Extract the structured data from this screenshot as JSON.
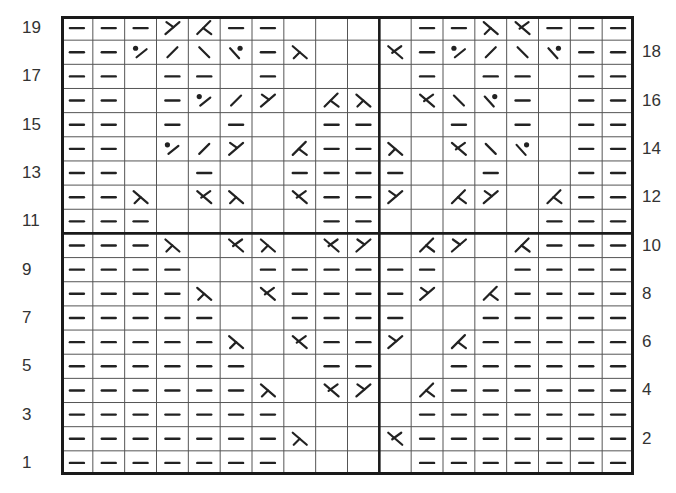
{
  "chart": {
    "title": "",
    "columns": 18,
    "rows": 19,
    "divider_after_col": 10,
    "divider_between_rows": [
      11,
      10
    ],
    "colors": {
      "ink": "#222222",
      "grid": "#555555",
      "border": "#1a1a1a",
      "label": "#333333"
    },
    "legend_symbols": {
      "dash": "purl (horizontal bar)",
      "empty": "knit (blank square)",
      "slash": "/",
      "bslash": "\\",
      "dotslash": "dot + /",
      "bslashdot": "\\ + dot",
      "lambda": "⋋",
      "kx": "⋌",
      "y": "Y",
      "ak": "⋏"
    }
  },
  "row_labels": {
    "left": [
      "19",
      "17",
      "15",
      "13",
      "11",
      "9",
      "7",
      "5",
      "3",
      "1"
    ],
    "right": [
      "18",
      "16",
      "14",
      "12",
      "10",
      "8",
      "6",
      "4",
      "2"
    ]
  },
  "chart_data": {
    "type": "table",
    "row_order": "top-to-bottom, row 19 first",
    "rows": [
      {
        "row": 19,
        "cells": [
          "dash",
          "dash",
          "dash",
          "y",
          "ak",
          "dash",
          "dash",
          "empty",
          "empty",
          "empty",
          "empty",
          "dash",
          "dash",
          "lambda",
          "kx",
          "dash",
          "dash",
          "dash"
        ]
      },
      {
        "row": 18,
        "cells": [
          "dash",
          "dash",
          "dotslash",
          "slash",
          "bslash",
          "bslashdot",
          "dash",
          "lambda",
          "empty",
          "empty",
          "kx",
          "dash",
          "dotslash",
          "slash",
          "bslash",
          "bslashdot",
          "dash",
          "dash"
        ]
      },
      {
        "row": 17,
        "cells": [
          "dash",
          "dash",
          "empty",
          "dash",
          "dash",
          "empty",
          "dash",
          "empty",
          "empty",
          "empty",
          "empty",
          "dash",
          "empty",
          "dash",
          "dash",
          "empty",
          "dash",
          "dash"
        ]
      },
      {
        "row": 16,
        "cells": [
          "dash",
          "dash",
          "empty",
          "dash",
          "dotslash",
          "slash",
          "y",
          "empty",
          "ak",
          "lambda",
          "empty",
          "kx",
          "bslash",
          "bslashdot",
          "dash",
          "empty",
          "dash",
          "dash"
        ]
      },
      {
        "row": 15,
        "cells": [
          "dash",
          "dash",
          "empty",
          "dash",
          "empty",
          "dash",
          "empty",
          "empty",
          "dash",
          "dash",
          "empty",
          "empty",
          "dash",
          "empty",
          "dash",
          "empty",
          "dash",
          "dash"
        ]
      },
      {
        "row": 14,
        "cells": [
          "dash",
          "dash",
          "empty",
          "dotslash",
          "slash",
          "y",
          "empty",
          "ak",
          "dash",
          "dash",
          "lambda",
          "empty",
          "kx",
          "bslash",
          "bslashdot",
          "empty",
          "dash",
          "dash"
        ]
      },
      {
        "row": 13,
        "cells": [
          "dash",
          "dash",
          "empty",
          "empty",
          "dash",
          "empty",
          "empty",
          "dash",
          "dash",
          "dash",
          "dash",
          "empty",
          "empty",
          "dash",
          "empty",
          "empty",
          "dash",
          "dash"
        ]
      },
      {
        "row": 12,
        "cells": [
          "dash",
          "dash",
          "lambda",
          "empty",
          "kx",
          "lambda",
          "empty",
          "kx",
          "dash",
          "dash",
          "y",
          "empty",
          "ak",
          "y",
          "empty",
          "ak",
          "dash",
          "dash"
        ]
      },
      {
        "row": 11,
        "cells": [
          "dash",
          "dash",
          "dash",
          "empty",
          "empty",
          "empty",
          "empty",
          "empty",
          "dash",
          "dash",
          "empty",
          "empty",
          "empty",
          "empty",
          "empty",
          "dash",
          "dash",
          "dash"
        ]
      },
      {
        "row": 10,
        "cells": [
          "dash",
          "dash",
          "dash",
          "lambda",
          "empty",
          "kx",
          "lambda",
          "empty",
          "kx",
          "y",
          "empty",
          "ak",
          "y",
          "empty",
          "ak",
          "dash",
          "dash",
          "dash"
        ]
      },
      {
        "row": 9,
        "cells": [
          "dash",
          "dash",
          "dash",
          "dash",
          "empty",
          "empty",
          "dash",
          "dash",
          "dash",
          "dash",
          "dash",
          "dash",
          "empty",
          "empty",
          "dash",
          "dash",
          "dash",
          "dash"
        ]
      },
      {
        "row": 8,
        "cells": [
          "dash",
          "dash",
          "dash",
          "dash",
          "lambda",
          "empty",
          "kx",
          "dash",
          "dash",
          "dash",
          "dash",
          "y",
          "empty",
          "ak",
          "dash",
          "dash",
          "dash",
          "dash"
        ]
      },
      {
        "row": 7,
        "cells": [
          "dash",
          "dash",
          "dash",
          "dash",
          "dash",
          "empty",
          "empty",
          "dash",
          "dash",
          "dash",
          "dash",
          "empty",
          "empty",
          "dash",
          "dash",
          "dash",
          "dash",
          "dash"
        ]
      },
      {
        "row": 6,
        "cells": [
          "dash",
          "dash",
          "dash",
          "dash",
          "dash",
          "lambda",
          "empty",
          "kx",
          "dash",
          "dash",
          "y",
          "empty",
          "ak",
          "dash",
          "dash",
          "dash",
          "dash",
          "dash"
        ]
      },
      {
        "row": 5,
        "cells": [
          "dash",
          "dash",
          "dash",
          "dash",
          "dash",
          "dash",
          "empty",
          "empty",
          "dash",
          "dash",
          "empty",
          "empty",
          "dash",
          "dash",
          "dash",
          "dash",
          "dash",
          "dash"
        ]
      },
      {
        "row": 4,
        "cells": [
          "dash",
          "dash",
          "dash",
          "dash",
          "dash",
          "dash",
          "lambda",
          "empty",
          "kx",
          "y",
          "empty",
          "ak",
          "dash",
          "dash",
          "dash",
          "dash",
          "dash",
          "dash"
        ]
      },
      {
        "row": 3,
        "cells": [
          "dash",
          "dash",
          "dash",
          "dash",
          "dash",
          "dash",
          "dash",
          "empty",
          "empty",
          "empty",
          "empty",
          "dash",
          "dash",
          "dash",
          "dash",
          "dash",
          "dash",
          "dash"
        ]
      },
      {
        "row": 2,
        "cells": [
          "dash",
          "dash",
          "dash",
          "dash",
          "dash",
          "dash",
          "dash",
          "lambda",
          "empty",
          "empty",
          "kx",
          "dash",
          "dash",
          "dash",
          "dash",
          "dash",
          "dash",
          "dash"
        ]
      },
      {
        "row": 1,
        "cells": [
          "dash",
          "dash",
          "dash",
          "dash",
          "dash",
          "dash",
          "dash",
          "empty",
          "empty",
          "empty",
          "empty",
          "dash",
          "dash",
          "dash",
          "dash",
          "dash",
          "dash",
          "dash"
        ]
      }
    ]
  }
}
